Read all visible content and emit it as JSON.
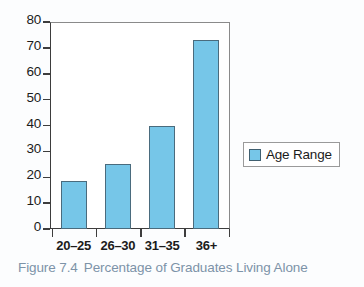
{
  "figure": {
    "caption_number": "Figure 7.4",
    "caption_text": "Percentage of Graduates Living Alone",
    "caption_color": "#7d93a8"
  },
  "legend": {
    "position": "right",
    "entries": [
      {
        "label": "Age Range",
        "color": "#76c6e8"
      }
    ]
  },
  "chart_data": {
    "type": "bar",
    "title": "Percentage of Graduates Living Alone",
    "xlabel": "",
    "ylabel": "",
    "categories": [
      "20–25",
      "26–30",
      "31–35",
      "36+"
    ],
    "values": [
      18.5,
      25,
      40,
      73
    ],
    "series": [
      {
        "name": "Age Range",
        "color": "#76c6e8",
        "values": [
          18.5,
          25,
          40,
          73
        ]
      }
    ],
    "ylim": [
      0,
      80
    ],
    "yticks": [
      0,
      10,
      20,
      30,
      40,
      50,
      60,
      70,
      80
    ],
    "ytick_labels": [
      "0",
      "10",
      "20",
      "30",
      "40",
      "50",
      "60",
      "70",
      "80"
    ],
    "grid": false,
    "legend_position": "right",
    "bar_fill": "#76c6e8",
    "bar_edge": "#4a6b7d",
    "plot_background": "#ffffff"
  }
}
